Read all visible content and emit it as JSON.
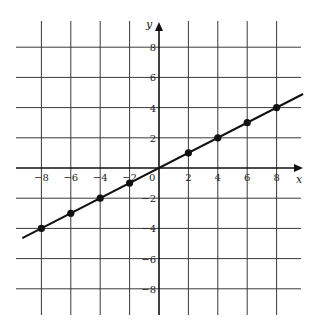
{
  "chart_data": {
    "type": "line",
    "title": "",
    "xlabel": "x",
    "ylabel": "y",
    "xlim": [
      -10,
      10
    ],
    "ylim": [
      -10,
      10
    ],
    "grid": true,
    "x_ticks": [
      -8,
      -6,
      -4,
      -2,
      2,
      4,
      6,
      8
    ],
    "y_ticks": [
      8,
      6,
      4,
      2,
      -2,
      -4,
      -6,
      -8
    ],
    "x_tick_labels": [
      "−8",
      "−6",
      "−4",
      "−2",
      "2",
      "4",
      "6",
      "8"
    ],
    "y_tick_labels": [
      "8",
      "6",
      "4",
      "2",
      "−2",
      "−4",
      "−6",
      "−8"
    ],
    "origin_label": "0",
    "series": [
      {
        "name": "y = x/2",
        "x": [
          -8,
          -6,
          -4,
          -2,
          2,
          4,
          6,
          8
        ],
        "y": [
          -4,
          -3,
          -2,
          -1,
          1,
          2,
          3,
          4
        ]
      }
    ],
    "line_extent": {
      "x_start": -9.3,
      "x_end": 9.8
    }
  }
}
